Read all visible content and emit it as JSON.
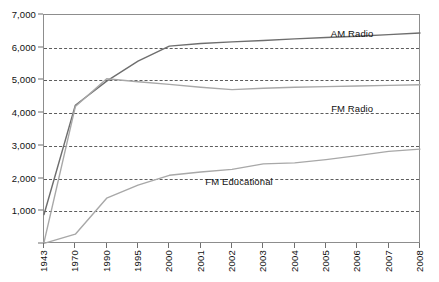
{
  "chart_data": {
    "type": "line",
    "title": "",
    "subtitle": "",
    "xlabel": "",
    "ylabel": "",
    "categories": [
      "1943",
      "1970",
      "1990",
      "1995",
      "2000",
      "2001",
      "2002",
      "2003",
      "2004",
      "2005",
      "2006",
      "2007",
      "2008"
    ],
    "ylim": [
      0,
      7000
    ],
    "ytick_values": [
      0,
      1000,
      2000,
      3000,
      4000,
      5000,
      6000,
      7000
    ],
    "ytick_labels": [
      "0",
      "1,000",
      "2,000",
      "3,000",
      "4,000",
      "5,000",
      "6,000",
      "7,000"
    ],
    "grid": "horizontal-dashed",
    "legend_position": "inline-labels",
    "series": [
      {
        "name": "AM Radio",
        "color": "#6e6e6e",
        "values": [
          900,
          4240,
          4980,
          5590,
          6050,
          6130,
          6180,
          6220,
          6270,
          6310,
          6350,
          6400,
          6450
        ],
        "label_x_pct": 82,
        "label_y_pct": 8.5
      },
      {
        "name": "FM Radio",
        "color": "#a8a8a8",
        "values": [
          50,
          4200,
          5050,
          4960,
          4880,
          4790,
          4720,
          4760,
          4790,
          4810,
          4830,
          4850,
          4870
        ],
        "label_x_pct": 82,
        "label_y_pct": 41
      },
      {
        "name": "FM Educational",
        "color": "#a8a8a8",
        "values": [
          20,
          300,
          1400,
          1800,
          2100,
          2200,
          2280,
          2450,
          2480,
          2580,
          2700,
          2830,
          2900
        ],
        "label_x_pct": 52,
        "label_y_pct": 73
      }
    ]
  }
}
